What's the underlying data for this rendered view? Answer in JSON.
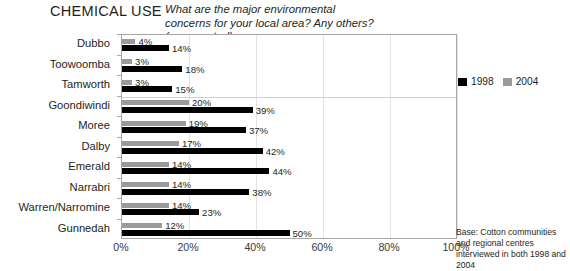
{
  "header": {
    "title": "CHEMICAL USE",
    "question": "What are the major environmental concerns for your local area? Any others? (unprompted)"
  },
  "legend": {
    "position": "top-right",
    "entries": [
      {
        "label": "1998",
        "color": "#000000"
      },
      {
        "label": "2004",
        "color": "#9a9a9a"
      }
    ]
  },
  "note": "Base: Cotton communities and regional centres interviewed in both 1998 and 2004",
  "chart_data": {
    "type": "bar",
    "orientation": "horizontal",
    "title": "CHEMICAL USE",
    "subtitle": "What are the major environmental concerns for your local area? Any others? (unprompted)",
    "xlabel": "",
    "ylabel": "",
    "xlim": [
      0,
      100
    ],
    "xticks": [
      "0%",
      "20%",
      "40%",
      "60%",
      "80%",
      "100%"
    ],
    "xtickvalues": [
      0,
      20,
      40,
      60,
      80,
      100
    ],
    "grid": "vertical",
    "categories": [
      "Dubbo",
      "Toowoomba",
      "Tamworth",
      "Goondiwindi",
      "Moree",
      "Dalby",
      "Emerald",
      "Narrabri",
      "Warren/Narromine",
      "Gunnedah"
    ],
    "series": [
      {
        "name": "1998",
        "color": "#000000",
        "values": [
          14,
          18,
          15,
          39,
          37,
          42,
          44,
          38,
          23,
          50
        ],
        "labels": [
          "14%",
          "18%",
          "15%",
          "39%",
          "37%",
          "42%",
          "44%",
          "38%",
          "23%",
          "50%"
        ]
      },
      {
        "name": "2004",
        "color": "#9a9a9a",
        "values": [
          4,
          3,
          3,
          20,
          19,
          17,
          14,
          14,
          14,
          12
        ],
        "labels": [
          "4%",
          "3%",
          "3%",
          "20%",
          "19%",
          "17%",
          "14%",
          "14%",
          "14%",
          "12%"
        ]
      }
    ],
    "separator_after_category_index": 2,
    "annotation": "Base: Cotton communities and regional centres interviewed in both 1998 and 2004"
  }
}
